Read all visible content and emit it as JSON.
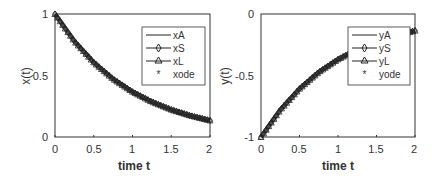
{
  "chart_data": [
    {
      "type": "line",
      "title": "",
      "xlabel": "time t",
      "ylabel": "x(t)",
      "xlim": [
        0,
        2
      ],
      "ylim": [
        0,
        1
      ],
      "xticks": [
        "0",
        "0.5",
        "1",
        "1.5",
        "2"
      ],
      "yticks": [
        "0",
        "0.5",
        "1"
      ],
      "grid": false,
      "legend_position": "upper right",
      "x": [
        0,
        0.25,
        0.5,
        0.75,
        1.0,
        1.25,
        1.5,
        1.75,
        2.0
      ],
      "series": [
        {
          "name": "xA",
          "marker": "none",
          "values": [
            1.0,
            0.779,
            0.607,
            0.472,
            0.368,
            0.287,
            0.223,
            0.174,
            0.135
          ]
        },
        {
          "name": "xS",
          "marker": "diamond",
          "values": [
            1.0,
            0.779,
            0.607,
            0.472,
            0.368,
            0.287,
            0.223,
            0.174,
            0.135
          ]
        },
        {
          "name": "xL",
          "marker": "triangle",
          "values": [
            1.0,
            0.779,
            0.607,
            0.472,
            0.368,
            0.287,
            0.223,
            0.174,
            0.135
          ]
        },
        {
          "name": "xode",
          "marker": "asterisk",
          "values": [
            1.0,
            0.779,
            0.607,
            0.472,
            0.368,
            0.287,
            0.223,
            0.174,
            0.135
          ]
        }
      ]
    },
    {
      "type": "line",
      "title": "",
      "xlabel": "time t",
      "ylabel": "y(t)",
      "xlim": [
        0,
        2
      ],
      "ylim": [
        -1,
        0
      ],
      "xticks": [
        "0",
        "0.5",
        "1",
        "1.5",
        "2"
      ],
      "yticks": [
        "-1",
        "-0.5",
        "0"
      ],
      "grid": false,
      "legend_position": "upper right",
      "x": [
        0,
        0.25,
        0.5,
        0.75,
        1.0,
        1.25,
        1.5,
        1.75,
        2.0
      ],
      "series": [
        {
          "name": "yA",
          "marker": "none",
          "values": [
            -1.0,
            -0.779,
            -0.607,
            -0.472,
            -0.368,
            -0.287,
            -0.223,
            -0.174,
            -0.135
          ]
        },
        {
          "name": "yS",
          "marker": "diamond",
          "values": [
            -1.0,
            -0.779,
            -0.607,
            -0.472,
            -0.368,
            -0.287,
            -0.223,
            -0.174,
            -0.135
          ]
        },
        {
          "name": "yL",
          "marker": "triangle",
          "values": [
            -1.0,
            -0.779,
            -0.607,
            -0.472,
            -0.368,
            -0.287,
            -0.223,
            -0.174,
            -0.135
          ]
        },
        {
          "name": "yode",
          "marker": "asterisk",
          "values": [
            -1.0,
            -0.779,
            -0.607,
            -0.472,
            -0.368,
            -0.287,
            -0.223,
            -0.174,
            -0.135
          ]
        }
      ]
    }
  ],
  "left": {
    "xlabel": "time t",
    "ylabel": "x(t)",
    "xticks": [
      "0",
      "0.5",
      "1",
      "1.5",
      "2"
    ],
    "yticks": [
      "0",
      "0.5",
      "1"
    ],
    "legend": [
      "xA",
      "xS",
      "xL",
      "xode"
    ]
  },
  "right": {
    "xlabel": "time t",
    "ylabel": "y(t)",
    "xticks": [
      "0",
      "0.5",
      "1",
      "1.5",
      "2"
    ],
    "yticks": [
      "-1",
      "-0.5",
      "0"
    ],
    "legend": [
      "yA",
      "yS",
      "yL",
      "yode"
    ]
  },
  "colors": {
    "line": "#222222",
    "axes": "#333333",
    "background": "#ffffff"
  }
}
